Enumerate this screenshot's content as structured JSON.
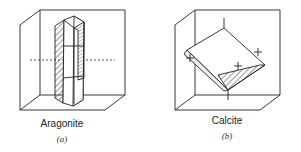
{
  "figures": [
    {
      "name": "Aragonite",
      "sublabel": "(a)"
    },
    {
      "name": "Calcite",
      "sublabel": "(b)"
    }
  ],
  "axis_markers": {
    "plus": "+",
    "minus": "−"
  }
}
